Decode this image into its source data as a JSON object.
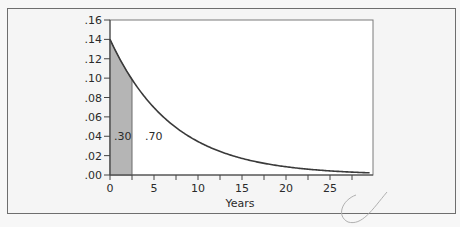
{
  "chart_data": {
    "type": "area",
    "title": "",
    "xlabel": "Years",
    "ylabel": "",
    "xlim": [
      0,
      29.5
    ],
    "ylim": [
      0,
      0.16
    ],
    "grid": false,
    "legend": null,
    "x_ticks": [
      0,
      5,
      10,
      15,
      20,
      25
    ],
    "x_tick_labels": [
      "0",
      "5",
      "10",
      "15",
      "20",
      "25"
    ],
    "x_minor_ticks": [
      2.5,
      7.5,
      12.5,
      17.5,
      22.5,
      27.5
    ],
    "y_ticks": [
      0,
      0.02,
      0.04,
      0.06,
      0.08,
      0.1,
      0.12,
      0.14,
      0.16
    ],
    "y_tick_labels": [
      ".00",
      ".02",
      ".04",
      ".06",
      ".08",
      ".10",
      ".12",
      ".14",
      ".16"
    ],
    "series": [
      {
        "name": "exponential density",
        "function": "0.14 * exp(-0.14 * x)",
        "rate": 0.14,
        "x": [
          0,
          2.5,
          5,
          7.5,
          10,
          12.5,
          15,
          17.5,
          20,
          22.5,
          25,
          27.5,
          29.5
        ],
        "values": [
          0.14,
          0.099,
          0.07,
          0.049,
          0.035,
          0.024,
          0.017,
          0.012,
          0.0085,
          0.006,
          0.0042,
          0.003,
          0.0022
        ]
      }
    ],
    "shaded_region": {
      "x_from": 0,
      "x_to": 2.5,
      "color": "#b5b5b5"
    },
    "annotations": [
      {
        "text": ".30",
        "x": 0.4,
        "y": 0.04,
        "meaning": "area left of 2.5"
      },
      {
        "text": ".70",
        "x": 4.0,
        "y": 0.04,
        "meaning": "area right of 2.5"
      }
    ]
  },
  "labels": {
    "xlabel": "Years",
    "left_area": ".30",
    "right_area": ".70"
  },
  "colors": {
    "curve": "#3a3a3a",
    "shade": "#b5b5b5",
    "plot_bg": "#ffffff",
    "frame_bg": "#f5f5f5"
  }
}
